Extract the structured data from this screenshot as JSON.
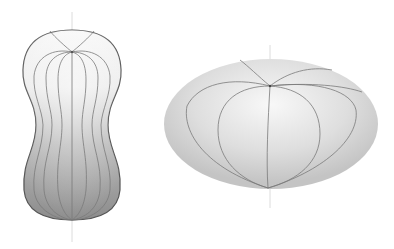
{
  "figure": {
    "left_shape": {
      "name": "peanut-shaped body of revolution",
      "axis": "vertical",
      "shading": "light at top to dark gray at bottom",
      "meridian_count": 9
    },
    "right_shape": {
      "name": "oblate spheroid",
      "axis": "vertical",
      "shading": "light gray, soft highlight",
      "meridian_count": 7
    },
    "colors": {
      "background": "#ffffff",
      "outline": "#555555",
      "meridian": "#7a7a7a",
      "axis": "#d8d8d8",
      "light": "#f4f4f4",
      "dark": "#8a8a8a"
    }
  }
}
